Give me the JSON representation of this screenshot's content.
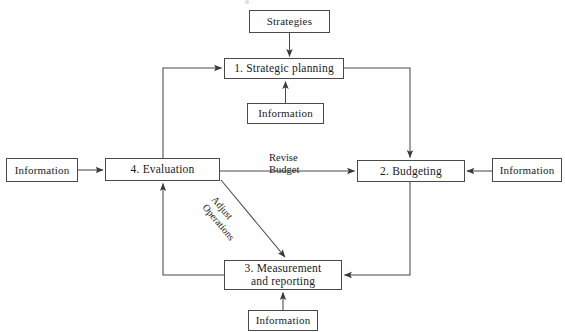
{
  "diagram": {
    "type": "flow-diagram",
    "colors": {
      "stroke": "#4a4a4a",
      "text": "#1b1b1b",
      "background": "#fefefe"
    },
    "nodes": {
      "strategies": {
        "label": "Strategies"
      },
      "box1": {
        "label": "1.  Strategic planning"
      },
      "box2": {
        "label": "2.  Budgeting"
      },
      "box3": {
        "label": "3.  Measurement\nand reporting"
      },
      "box4": {
        "label": "4.  Evaluation"
      },
      "info_top": {
        "label": "Information"
      },
      "info_left": {
        "label": "Information"
      },
      "info_right": {
        "label": "Information"
      },
      "info_bottom": {
        "label": "Information"
      }
    },
    "edge_labels": {
      "revise_budget": "Revise\nBudget",
      "adjust_operations": "Adjust\nOperations"
    }
  }
}
